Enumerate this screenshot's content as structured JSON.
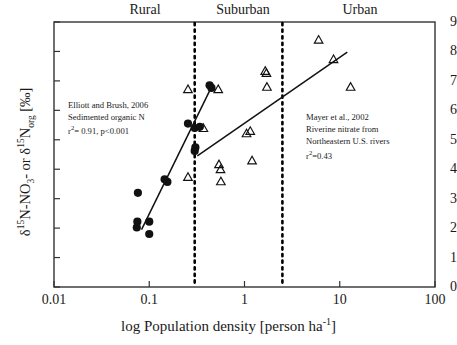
{
  "chart_data": {
    "type": "scatter",
    "title": "",
    "xlabel": "log Population density [person ha-1]",
    "ylabel": "d15N-NO3- or d15Norg [‰]",
    "xscale": "log",
    "xlim": [
      0.01,
      100
    ],
    "ylim": [
      0,
      9
    ],
    "xticks": [
      "0.01",
      "0.1",
      "1",
      "10",
      "100"
    ],
    "xtick_values": [
      0.01,
      0.1,
      1,
      10,
      100
    ],
    "yticks": [
      "0",
      "1",
      "2",
      "3",
      "4",
      "5",
      "6",
      "7",
      "8",
      "9"
    ],
    "ytick_values": [
      0,
      1,
      2,
      3,
      4,
      5,
      6,
      7,
      8,
      9
    ],
    "grid": false,
    "legend": "none",
    "zone_labels": [
      "Rural",
      "Suburban",
      "Urban"
    ],
    "zone_dividers": [
      0.3,
      2.5
    ],
    "series": [
      {
        "name": "Elliott and Brush, 2006 - Sedimented organic N",
        "marker": "filled-circle",
        "color": "#111111",
        "points": [
          [
            0.076,
            3.2
          ],
          [
            0.075,
            2.22
          ],
          [
            0.074,
            2.02
          ],
          [
            0.1,
            2.22
          ],
          [
            0.1,
            1.8
          ],
          [
            0.145,
            3.66
          ],
          [
            0.155,
            3.57
          ],
          [
            0.255,
            5.55
          ],
          [
            0.3,
            5.4
          ],
          [
            0.34,
            5.44
          ],
          [
            0.305,
            4.74
          ],
          [
            0.3,
            4.62
          ],
          [
            0.43,
            6.85
          ],
          [
            0.45,
            6.76
          ]
        ],
        "fit_line": {
          "x0": 0.083,
          "y0": 1.95,
          "x1": 0.455,
          "y1": 6.82
        },
        "r2": 0.91,
        "p": "<0.001"
      },
      {
        "name": "Mayer et al., 2002 - Riverine nitrate from Northeastern U.S. rivers",
        "marker": "open-triangle",
        "color": "#111111",
        "points": [
          [
            0.255,
            6.7
          ],
          [
            0.255,
            3.72
          ],
          [
            0.37,
            5.38
          ],
          [
            0.53,
            6.7
          ],
          [
            0.54,
            4.15
          ],
          [
            0.56,
            3.98
          ],
          [
            0.565,
            3.57
          ],
          [
            1.05,
            5.2
          ],
          [
            1.15,
            5.28
          ],
          [
            1.2,
            4.28
          ],
          [
            1.65,
            7.32
          ],
          [
            1.7,
            7.25
          ],
          [
            1.72,
            6.78
          ],
          [
            6.0,
            8.38
          ],
          [
            8.6,
            7.72
          ],
          [
            13.0,
            6.78
          ]
        ],
        "fit_line": {
          "x0": 0.32,
          "y0": 4.45,
          "x1": 12.0,
          "y1": 7.98
        },
        "r2": 0.43
      }
    ]
  },
  "annotations": {
    "left": {
      "line1": "Elliott and Brush, 2006",
      "line2": "Sedimented organic N",
      "line3_pre": "r",
      "line3_sup": "2",
      "line3_post": "= 0.91, p<0.001"
    },
    "right": {
      "line1": "Mayer et al., 2002",
      "line2": "Riverine nitrate from",
      "line3": "Northeastern U.S. rivers",
      "line4_pre": "r",
      "line4_sup": "2",
      "line4_post": "=0.43"
    }
  },
  "axis_labels": {
    "x_pre": "log Population density [person ha",
    "x_sup": "-1",
    "x_post": "]",
    "y_d1": "δ",
    "y_sup1": "15",
    "y_mid1": "N-NO",
    "y_sub1": "3",
    "y_mid2": "- or ",
    "y_d2": "δ",
    "y_sup2": "15",
    "y_mid3": "N",
    "y_sub2": "org",
    "y_end": " [‰]"
  },
  "style": {
    "axis_color": "#333333",
    "marker_color": "#111111",
    "divider_color": "#000000",
    "background": "#ffffff"
  }
}
